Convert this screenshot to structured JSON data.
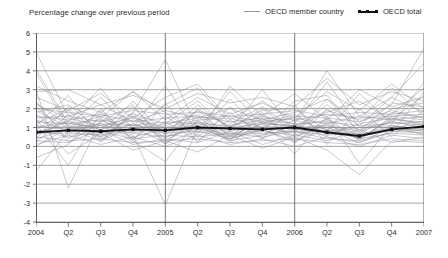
{
  "header": {
    "title": "Percentage change over previous period"
  },
  "legend": {
    "position": "top-right",
    "items": [
      {
        "label": "OECD member country",
        "style": "thin-gray-line",
        "color": "#9a9aa2",
        "icon": "line-icon"
      },
      {
        "label": "OECD total",
        "style": "thick-black-line-with-markers",
        "color": "#121216",
        "icon": "line-marker-icon"
      }
    ]
  },
  "chart_data": {
    "type": "line",
    "title": "Percentage change over previous period",
    "xlabel": "",
    "ylabel": "",
    "ylim": [
      -4,
      6
    ],
    "yticks": [
      6,
      5,
      4,
      3,
      2,
      1,
      0,
      -1,
      -2,
      -3,
      -4
    ],
    "ytick_labels": [
      "6",
      "5",
      "4",
      "3",
      "2",
      "1",
      "0",
      "-1",
      "-2",
      "-3",
      "-4"
    ],
    "grid": true,
    "grid_color": "#8d8d95",
    "year_dividers": [
      "2005",
      "2006"
    ],
    "x": [
      "2004",
      "Q2",
      "Q3",
      "Q4",
      "2005",
      "Q2",
      "Q3",
      "Q4",
      "2006",
      "Q2",
      "Q3",
      "Q4",
      "2007"
    ],
    "xtick_labels": [
      "2004",
      "Q2",
      "Q3",
      "Q4",
      "2005",
      "Q2",
      "Q3",
      "Q4",
      "2006",
      "Q2",
      "Q3",
      "Q4",
      "2007"
    ],
    "highlight_series": {
      "name": "OECD total",
      "color": "#121216",
      "marker": "square",
      "values": [
        0.75,
        0.85,
        0.8,
        0.9,
        0.85,
        1.0,
        0.95,
        0.9,
        1.0,
        0.75,
        0.55,
        0.9,
        1.05
      ]
    },
    "series": [
      {
        "name": "OECD member country",
        "values": [
          5.0,
          1.6,
          2.2,
          1.3,
          1.9,
          1.5,
          2.0,
          1.4,
          1.8,
          2.5,
          1.3,
          2.2,
          5.2
        ]
      },
      {
        "name": "OECD member country",
        "values": [
          4.1,
          1.2,
          1.0,
          1.6,
          0.8,
          1.9,
          1.1,
          1.6,
          1.2,
          3.4,
          1.0,
          1.7,
          3.1
        ]
      },
      {
        "name": "OECD member country",
        "values": [
          3.2,
          2.4,
          1.8,
          2.9,
          1.4,
          2.6,
          1.7,
          2.3,
          1.5,
          2.9,
          1.9,
          3.3,
          2.0
        ]
      },
      {
        "name": "OECD member country",
        "values": [
          3.0,
          -2.2,
          1.4,
          0.6,
          -3.1,
          1.0,
          0.4,
          0.9,
          0.2,
          1.3,
          0.6,
          1.1,
          0.9
        ]
      },
      {
        "name": "OECD member country",
        "values": [
          2.6,
          1.9,
          0.3,
          1.8,
          4.6,
          0.9,
          2.9,
          1.2,
          1.1,
          1.8,
          2.4,
          1.4,
          2.7
        ]
      },
      {
        "name": "OECD member country",
        "values": [
          2.3,
          1.1,
          2.6,
          0.9,
          2.2,
          3.1,
          1.2,
          2.1,
          0.9,
          2.2,
          1.1,
          2.6,
          1.8
        ]
      },
      {
        "name": "OECD member country",
        "values": [
          2.2,
          1.5,
          1.1,
          1.5,
          1.0,
          1.4,
          1.5,
          1.0,
          1.6,
          1.5,
          1.3,
          1.9,
          1.5
        ]
      },
      {
        "name": "OECD member country",
        "values": [
          2.1,
          0.6,
          1.9,
          0.4,
          1.6,
          0.5,
          1.8,
          0.6,
          1.4,
          0.9,
          0.4,
          1.5,
          1.2
        ]
      },
      {
        "name": "OECD member country",
        "values": [
          2.0,
          1.8,
          1.6,
          1.9,
          1.7,
          1.8,
          1.6,
          1.7,
          1.9,
          1.6,
          1.8,
          1.7,
          1.9
        ]
      },
      {
        "name": "OECD member country",
        "values": [
          1.9,
          1.0,
          1.2,
          1.1,
          0.9,
          1.3,
          1.0,
          1.2,
          1.1,
          1.4,
          0.9,
          1.3,
          1.1
        ]
      },
      {
        "name": "OECD member country",
        "values": [
          1.8,
          2.2,
          0.8,
          2.4,
          0.6,
          2.2,
          0.9,
          2.0,
          0.7,
          2.5,
          0.8,
          2.3,
          2.1
        ]
      },
      {
        "name": "OECD member country",
        "values": [
          1.7,
          0.4,
          1.5,
          0.2,
          1.3,
          0.3,
          1.4,
          0.4,
          1.2,
          0.5,
          0.2,
          1.0,
          0.8
        ]
      },
      {
        "name": "OECD member country",
        "values": [
          1.6,
          1.4,
          1.7,
          1.3,
          1.5,
          1.6,
          1.3,
          1.5,
          1.4,
          1.7,
          1.5,
          1.6,
          1.4
        ]
      },
      {
        "name": "OECD member country",
        "values": [
          1.5,
          1.6,
          1.3,
          1.7,
          1.2,
          1.5,
          1.6,
          1.3,
          1.5,
          1.2,
          1.6,
          1.4,
          1.6
        ]
      },
      {
        "name": "OECD member country",
        "values": [
          1.4,
          0.8,
          1.0,
          0.7,
          0.5,
          0.9,
          0.7,
          0.8,
          0.6,
          1.0,
          0.5,
          0.9,
          0.7
        ]
      },
      {
        "name": "OECD member country",
        "values": [
          1.3,
          1.2,
          1.4,
          1.1,
          1.3,
          1.2,
          1.1,
          1.4,
          1.2,
          1.3,
          1.1,
          1.2,
          1.3
        ]
      },
      {
        "name": "OECD member country",
        "values": [
          1.2,
          2.0,
          0.6,
          2.1,
          0.4,
          1.9,
          0.5,
          1.8,
          0.3,
          2.0,
          0.6,
          1.8,
          1.5
        ]
      },
      {
        "name": "OECD member country",
        "values": [
          1.1,
          0.9,
          1.1,
          0.8,
          1.0,
          0.9,
          1.0,
          0.9,
          1.1,
          0.8,
          1.0,
          1.1,
          0.9
        ]
      },
      {
        "name": "OECD member country",
        "values": [
          1.0,
          1.3,
          0.9,
          1.4,
          0.8,
          1.2,
          0.9,
          1.3,
          1.0,
          1.1,
          0.8,
          1.3,
          1.0
        ]
      },
      {
        "name": "OECD member country",
        "values": [
          0.9,
          0.5,
          0.8,
          0.4,
          0.6,
          0.5,
          0.7,
          0.5,
          0.8,
          0.4,
          0.3,
          0.7,
          0.6
        ]
      },
      {
        "name": "OECD member country",
        "values": [
          0.8,
          1.1,
          0.7,
          1.2,
          0.5,
          1.0,
          0.8,
          1.1,
          0.9,
          0.7,
          0.5,
          1.0,
          1.2
        ]
      },
      {
        "name": "OECD member country",
        "values": [
          0.7,
          0.7,
          0.6,
          0.9,
          0.7,
          0.8,
          0.6,
          0.7,
          0.8,
          0.6,
          0.7,
          0.8,
          0.7
        ]
      },
      {
        "name": "OECD member country",
        "values": [
          0.6,
          1.4,
          0.5,
          1.6,
          0.3,
          1.3,
          0.4,
          1.5,
          0.5,
          1.2,
          0.4,
          1.4,
          1.3
        ]
      },
      {
        "name": "OECD member country",
        "values": [
          0.5,
          0.3,
          0.4,
          0.2,
          0.3,
          0.4,
          0.2,
          0.3,
          0.4,
          0.2,
          0.1,
          0.4,
          0.3
        ]
      },
      {
        "name": "OECD member country",
        "values": [
          0.4,
          0.9,
          0.3,
          1.0,
          0.2,
          0.8,
          0.4,
          0.9,
          0.3,
          0.9,
          0.2,
          0.8,
          0.9
        ]
      },
      {
        "name": "OECD member country",
        "values": [
          0.3,
          0.2,
          0.9,
          0.1,
          0.4,
          0.2,
          0.8,
          0.1,
          0.6,
          0.3,
          0.9,
          0.2,
          0.5
        ]
      },
      {
        "name": "OECD member country",
        "values": [
          0.2,
          1.7,
          0.2,
          1.8,
          0.1,
          1.6,
          0.3,
          1.7,
          0.2,
          1.5,
          0.3,
          1.6,
          1.7
        ]
      },
      {
        "name": "OECD member country",
        "values": [
          0.1,
          0.6,
          0.1,
          0.5,
          0.0,
          0.6,
          0.1,
          0.4,
          0.0,
          0.5,
          0.0,
          0.6,
          0.4
        ]
      },
      {
        "name": "OECD member country",
        "values": [
          0.0,
          1.0,
          1.6,
          0.7,
          1.1,
          1.7,
          0.6,
          1.2,
          1.7,
          0.6,
          1.2,
          1.5,
          1.1
        ]
      },
      {
        "name": "OECD member country",
        "values": [
          -1.3,
          0.8,
          1.2,
          0.5,
          0.9,
          1.1,
          0.5,
          1.0,
          0.7,
          1.1,
          0.6,
          1.0,
          0.8
        ]
      },
      {
        "name": "OECD member country",
        "values": [
          -0.6,
          0.1,
          2.0,
          0.3,
          2.3,
          0.2,
          2.1,
          0.4,
          2.2,
          0.1,
          2.0,
          0.5,
          1.9
        ]
      },
      {
        "name": "OECD member country",
        "values": [
          2.9,
          3.0,
          2.2,
          2.7,
          2.0,
          2.8,
          2.3,
          2.6,
          2.1,
          3.6,
          2.2,
          2.9,
          2.4
        ]
      },
      {
        "name": "OECD member country",
        "values": [
          1.4,
          -0.4,
          0.7,
          -0.2,
          0.3,
          -0.3,
          0.6,
          -0.1,
          0.5,
          -0.2,
          -1.5,
          0.3,
          0.2
        ]
      },
      {
        "name": "OECD member country",
        "values": [
          0.9,
          1.9,
          2.8,
          1.5,
          2.6,
          3.3,
          1.4,
          2.4,
          1.3,
          4.0,
          1.6,
          2.6,
          4.4
        ]
      },
      {
        "name": "OECD member country",
        "values": [
          2.4,
          0.2,
          1.3,
          2.2,
          0.1,
          2.0,
          1.0,
          1.9,
          2.0,
          0.8,
          2.8,
          1.2,
          3.4
        ]
      },
      {
        "name": "OECD member country",
        "values": [
          1.1,
          2.7,
          0.4,
          1.0,
          3.2,
          0.7,
          2.5,
          0.8,
          2.4,
          2.7,
          0.7,
          2.0,
          2.3
        ]
      },
      {
        "name": "OECD member country",
        "values": [
          0.6,
          1.3,
          3.1,
          0.9,
          1.2,
          2.4,
          0.9,
          3.0,
          0.8,
          1.9,
          1.4,
          3.1,
          1.6
        ]
      },
      {
        "name": "OECD member country",
        "values": [
          3.9,
          1.0,
          0.5,
          1.2,
          0.7,
          1.1,
          0.3,
          0.6,
          0.9,
          1.0,
          0.4,
          0.7,
          2.9
        ]
      },
      {
        "name": "OECD member country",
        "values": [
          1.2,
          -1.0,
          1.8,
          0.3,
          -0.8,
          1.4,
          0.2,
          1.3,
          -0.4,
          1.6,
          -0.9,
          1.1,
          0.6
        ]
      },
      {
        "name": "OECD member country",
        "values": [
          0.4,
          2.1,
          1.5,
          2.9,
          1.8,
          0.6,
          3.2,
          1.6,
          2.8,
          1.4,
          3.0,
          2.1,
          2.6
        ]
      }
    ]
  }
}
